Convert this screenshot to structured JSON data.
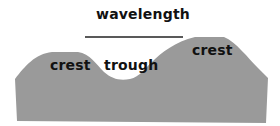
{
  "diagram": {
    "title_label": "wavelength",
    "labels": {
      "left_crest": "crest",
      "trough": "trough",
      "right_crest": "crest"
    },
    "colors": {
      "wave_fill": "#9a9a9a",
      "line": "#222222",
      "text": "#111111",
      "background": "#ffffff"
    }
  }
}
